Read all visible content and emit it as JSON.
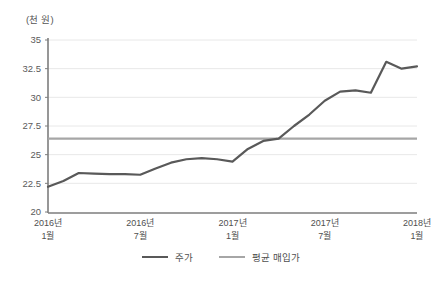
{
  "chart_data": {
    "type": "line",
    "title": "",
    "subtitle": "",
    "ylabel": "(천 원)",
    "xlabel": "",
    "ylim": [
      20,
      35
    ],
    "yticks": [
      20,
      22.5,
      25,
      27.5,
      30,
      32.5,
      35
    ],
    "ytick_labels": [
      "20",
      "22.5",
      "25",
      "27.5",
      "30",
      "32.5",
      "35"
    ],
    "grid": true,
    "grid_axis": "y",
    "legend_position": "bottom",
    "x": [
      "2016-01",
      "2016-02",
      "2016-03",
      "2016-04",
      "2016-05",
      "2016-06",
      "2016-07",
      "2016-08",
      "2016-09",
      "2016-10",
      "2016-11",
      "2016-12",
      "2017-01",
      "2017-02",
      "2017-03",
      "2017-04",
      "2017-05",
      "2017-06",
      "2017-07",
      "2017-08",
      "2017-09",
      "2017-10",
      "2017-11",
      "2017-12",
      "2018-01"
    ],
    "xtick_positions": [
      0,
      6,
      12,
      18,
      24
    ],
    "xtick_labels": [
      {
        "line1": "2016년",
        "line2": "1월"
      },
      {
        "line1": "2016년",
        "line2": "7월"
      },
      {
        "line1": "2017년",
        "line2": "1월"
      },
      {
        "line1": "2017년",
        "line2": "7월"
      },
      {
        "line1": "2018년",
        "line2": "1월"
      }
    ],
    "series": [
      {
        "name": "주가",
        "kind": "line",
        "color": "#595959",
        "values": [
          22.2,
          22.7,
          23.4,
          23.35,
          23.3,
          23.3,
          23.25,
          23.8,
          24.3,
          24.6,
          24.7,
          24.6,
          24.4,
          25.5,
          26.2,
          26.4,
          27.5,
          28.5,
          29.7,
          30.5,
          30.6,
          30.4,
          33.1,
          32.5,
          32.7
        ]
      },
      {
        "name": "평균 매입가",
        "kind": "hline",
        "color": "#a6a6a6",
        "value": 26.4,
        "values": [
          26.4,
          26.4,
          26.4,
          26.4,
          26.4,
          26.4,
          26.4,
          26.4,
          26.4,
          26.4,
          26.4,
          26.4,
          26.4,
          26.4,
          26.4,
          26.4,
          26.4,
          26.4,
          26.4,
          26.4,
          26.4,
          26.4,
          26.4,
          26.4,
          26.4
        ]
      }
    ]
  },
  "legend": {
    "items": [
      {
        "label": "주가"
      },
      {
        "label": "평균 매입가"
      }
    ]
  },
  "colors": {
    "series_price": "#595959",
    "series_avg": "#a6a6a6",
    "axis": "#808080",
    "grid": "#e8e8e8",
    "text": "#4f4f4f",
    "background": "#ffffff"
  }
}
